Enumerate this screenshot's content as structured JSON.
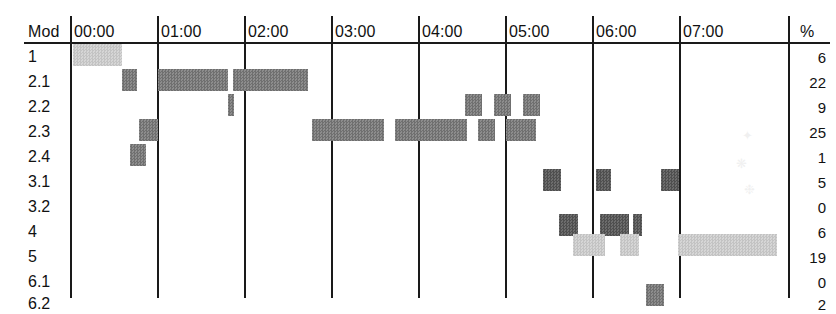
{
  "header": {
    "row_label_header": "Mod",
    "percent_header": "%",
    "time_labels": [
      "00:00",
      "01:00",
      "02:00",
      "03:00",
      "04:00",
      "05:00",
      "06:00",
      "07:00"
    ]
  },
  "rows": [
    {
      "label": "1",
      "percent": "6"
    },
    {
      "label": "2.1",
      "percent": "22"
    },
    {
      "label": "2.2",
      "percent": "9"
    },
    {
      "label": "2.3",
      "percent": "25"
    },
    {
      "label": "2.4",
      "percent": "1"
    },
    {
      "label": "3.1",
      "percent": "5"
    },
    {
      "label": "3.2",
      "percent": "0"
    },
    {
      "label": "4",
      "percent": "6"
    },
    {
      "label": "5",
      "percent": "19"
    },
    {
      "label": "6.1",
      "percent": "0"
    },
    {
      "label": "6.2",
      "percent": "2"
    }
  ],
  "colors": {
    "light_bar": "#cccccc",
    "dark_bar": "#7b7b7b",
    "darker_bar": "#5d5d5d",
    "grid_line": "#1a1a1a",
    "background": "#ffffff"
  },
  "chart_data": {
    "type": "bar",
    "title": "",
    "xlabel": "",
    "ylabel": "Mod",
    "orientation": "horizontal-timeline",
    "grid": true,
    "legend": "none",
    "x_axis": {
      "type": "time",
      "ticks": [
        "00:00",
        "01:00",
        "02:00",
        "03:00",
        "04:00",
        "05:00",
        "06:00",
        "07:00"
      ],
      "tick_px": [
        70,
        157,
        244,
        331,
        418,
        505,
        592,
        679
      ],
      "px_per_hour": 87,
      "range": [
        "00:00",
        "07:30"
      ]
    },
    "categories": [
      "1",
      "2.1",
      "2.2",
      "2.3",
      "2.4",
      "3.1",
      "3.2",
      "4",
      "5",
      "6.1",
      "6.2"
    ],
    "values": [
      6,
      22,
      9,
      25,
      1,
      5,
      0,
      6,
      19,
      0,
      2
    ],
    "value_unit": "%",
    "series": [
      {
        "name": "1",
        "percent": 6,
        "shade": "light",
        "segments": [
          {
            "start_px": 73,
            "end_px": 122,
            "start_time": "00:02",
            "end_time": "00:36"
          }
        ]
      },
      {
        "name": "2.1",
        "percent": 22,
        "shade": "dark",
        "segments": [
          {
            "start_px": 122,
            "end_px": 137,
            "start_time": "00:36",
            "end_time": "00:46"
          },
          {
            "start_px": 158,
            "end_px": 228,
            "start_time": "01:01",
            "end_time": "01:49"
          },
          {
            "start_px": 233,
            "end_px": 308,
            "start_time": "01:52",
            "end_time": "02:44"
          }
        ]
      },
      {
        "name": "2.2",
        "percent": 9,
        "shade": "dark",
        "segments": [
          {
            "start_px": 228,
            "end_px": 234,
            "start_time": "01:49",
            "end_time": "01:53"
          },
          {
            "start_px": 465,
            "end_px": 482,
            "start_time": "04:32",
            "end_time": "04:44"
          },
          {
            "start_px": 494,
            "end_px": 511,
            "start_time": "04:52",
            "end_time": "05:04"
          },
          {
            "start_px": 523,
            "end_px": 540,
            "start_time": "05:12",
            "end_time": "05:24"
          }
        ]
      },
      {
        "name": "2.3",
        "percent": 25,
        "shade": "dark",
        "segments": [
          {
            "start_px": 139,
            "end_px": 158,
            "start_time": "00:48",
            "end_time": "01:01"
          },
          {
            "start_px": 312,
            "end_px": 384,
            "start_time": "02:47",
            "end_time": "03:36"
          },
          {
            "start_px": 395,
            "end_px": 467,
            "start_time": "03:44",
            "end_time": "04:34"
          },
          {
            "start_px": 478,
            "end_px": 495,
            "start_time": "04:41",
            "end_time": "04:53"
          },
          {
            "start_px": 506,
            "end_px": 536,
            "start_time": "05:00",
            "end_time": "05:21"
          }
        ]
      },
      {
        "name": "2.4",
        "percent": 1,
        "shade": "dark",
        "segments": [
          {
            "start_px": 130,
            "end_px": 146,
            "start_time": "00:41",
            "end_time": "00:52"
          }
        ]
      },
      {
        "name": "3.1",
        "percent": 5,
        "shade": "darker",
        "segments": [
          {
            "start_px": 543,
            "end_px": 561,
            "start_time": "05:26",
            "end_time": "05:38"
          },
          {
            "start_px": 596,
            "end_px": 611,
            "start_time": "06:03",
            "end_time": "06:13"
          },
          {
            "start_px": 661,
            "end_px": 679,
            "start_time": "06:47",
            "end_time": "07:00"
          }
        ]
      },
      {
        "name": "3.2",
        "percent": 0,
        "shade": "dark",
        "segments": []
      },
      {
        "name": "4",
        "percent": 6,
        "shade": "darker",
        "segments": [
          {
            "start_px": 559,
            "end_px": 578,
            "start_time": "05:37",
            "end_time": "05:50"
          },
          {
            "start_px": 600,
            "end_px": 629,
            "start_time": "06:06",
            "end_time": "06:26"
          },
          {
            "start_px": 633,
            "end_px": 642,
            "start_time": "06:28",
            "end_time": "06:35"
          }
        ]
      },
      {
        "name": "5",
        "percent": 19,
        "shade": "light",
        "segments": [
          {
            "start_px": 573,
            "end_px": 605,
            "start_time": "05:47",
            "end_time": "06:09"
          },
          {
            "start_px": 620,
            "end_px": 639,
            "start_time": "06:19",
            "end_time": "06:32"
          },
          {
            "start_px": 678,
            "end_px": 777,
            "start_time": "06:59",
            "end_time": "08:07"
          }
        ]
      },
      {
        "name": "6.1",
        "percent": 0,
        "shade": "dark",
        "segments": []
      },
      {
        "name": "6.2",
        "percent": 2,
        "shade": "dark",
        "segments": [
          {
            "start_px": 646,
            "end_px": 664,
            "start_time": "06:37",
            "end_time": "06:49"
          }
        ]
      }
    ]
  }
}
